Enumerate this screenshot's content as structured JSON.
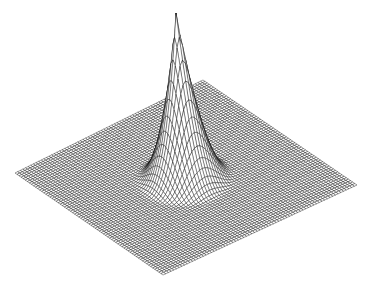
{
  "figure": {
    "type": "3d-wireframe-surface",
    "background": "#ffffff",
    "line_color": "#000000",
    "fill_color": "#ffffff"
  },
  "chart_data": {
    "type": "surface",
    "title": "",
    "xlabel": "",
    "ylabel": "",
    "zlabel": "",
    "grid": {
      "n": 72,
      "range": [
        -1,
        1
      ]
    },
    "function": "z = max(0, 1 - r/r0)^p, r = sqrt(x^2 + y^2)",
    "params": {
      "r0": 0.42,
      "p": 2.2
    },
    "axes_visible": false,
    "legend": false,
    "projection": {
      "corner_left": [
        15,
        173
      ],
      "corner_top": [
        203,
        80
      ],
      "corner_right": [
        357,
        185
      ],
      "corner_bottom": [
        163,
        275
      ],
      "apex": [
        176,
        13
      ]
    }
  }
}
